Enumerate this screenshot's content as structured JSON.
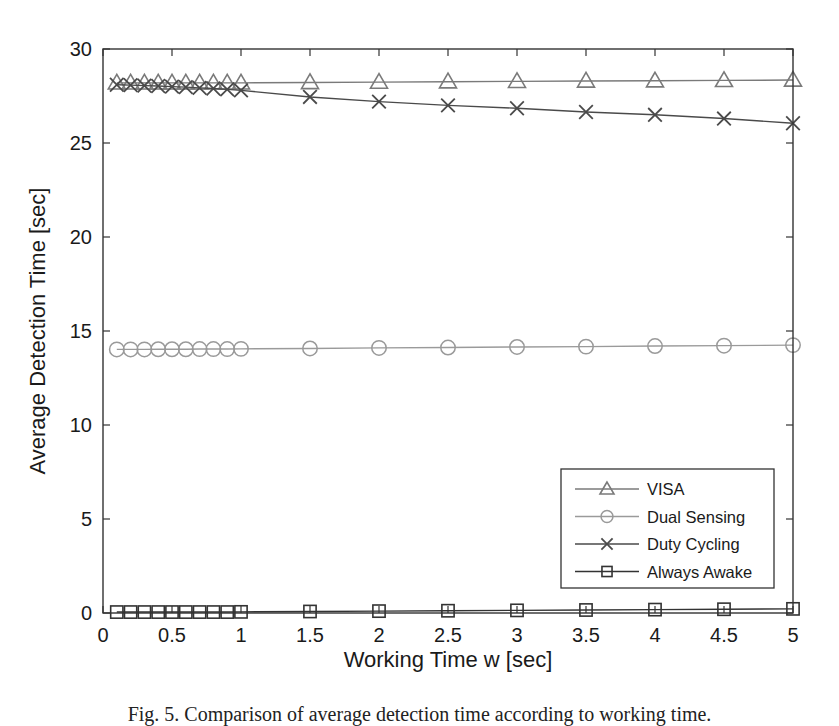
{
  "chart_data": {
    "type": "line",
    "title": "",
    "xlabel": "Working Time w [sec]",
    "ylabel": "Average Detection Time [sec]",
    "xlim": [
      0,
      5
    ],
    "ylim": [
      0,
      30
    ],
    "x_ticks": [
      0,
      0.5,
      1,
      1.5,
      2,
      2.5,
      3,
      3.5,
      4,
      4.5,
      5
    ],
    "x_tick_labels": [
      "0",
      "0.5",
      "1",
      "1.5",
      "2",
      "2.5",
      "3",
      "3.5",
      "4",
      "4.5",
      "5"
    ],
    "y_ticks": [
      0,
      5,
      10,
      15,
      20,
      25,
      30
    ],
    "y_tick_labels": [
      "0",
      "5",
      "10",
      "15",
      "20",
      "25",
      "30"
    ],
    "grid": false,
    "legend_position": "lower right",
    "x": [
      0.1,
      0.2,
      0.3,
      0.4,
      0.5,
      0.6,
      0.7,
      0.8,
      0.9,
      1.0,
      1.5,
      2.0,
      2.5,
      3.0,
      3.5,
      4.0,
      4.5,
      5.0
    ],
    "series": [
      {
        "name": "VISA",
        "marker": "triangle",
        "color": "#7a7a7a",
        "values": [
          28.2,
          28.2,
          28.2,
          28.2,
          28.2,
          28.2,
          28.2,
          28.2,
          28.2,
          28.2,
          28.22,
          28.24,
          28.26,
          28.28,
          28.3,
          28.31,
          28.33,
          28.35
        ]
      },
      {
        "name": "Dual Sensing",
        "marker": "circle",
        "color": "#9a9a9a",
        "values": [
          14.02,
          14.02,
          14.02,
          14.03,
          14.03,
          14.03,
          14.04,
          14.04,
          14.04,
          14.05,
          14.07,
          14.1,
          14.12,
          14.15,
          14.17,
          14.2,
          14.22,
          14.25
        ]
      },
      {
        "name": "Duty Cycling",
        "marker": "x",
        "color": "#4a4a4a",
        "values": [
          28.1,
          28.08,
          28.05,
          28.03,
          28.0,
          27.97,
          27.93,
          27.9,
          27.85,
          27.8,
          27.45,
          27.2,
          27.0,
          26.85,
          26.65,
          26.5,
          26.3,
          26.05
        ]
      },
      {
        "name": "Always Awake",
        "marker": "square",
        "color": "#333333",
        "values": [
          0.05,
          0.05,
          0.05,
          0.05,
          0.05,
          0.05,
          0.05,
          0.05,
          0.05,
          0.06,
          0.08,
          0.1,
          0.12,
          0.14,
          0.16,
          0.18,
          0.2,
          0.22
        ]
      }
    ]
  },
  "caption": "Fig. 5. Comparison of average detection time according to working time."
}
